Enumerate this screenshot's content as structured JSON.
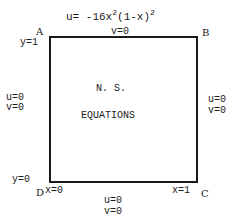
{
  "diagram": {
    "top_condition": {
      "u_prefix": "u=  -16x",
      "exp1": "2",
      "mid": "(1-x)",
      "exp2": "2",
      "v": "v=0"
    },
    "corners": {
      "A": "A",
      "B": "B",
      "C": "C",
      "D": "D"
    },
    "axis_labels": {
      "y_top": "y=1",
      "y_bottom": "y=0",
      "x_left": "x=0",
      "x_right": "x=1"
    },
    "left_condition": {
      "u": "u=0",
      "v": "v=0"
    },
    "right_condition": {
      "u": "u=0",
      "v": "v=0"
    },
    "bottom_condition": {
      "u": "u=0",
      "v": "v=0"
    },
    "center_text": {
      "line1": "N. S.",
      "line2": "EQUATIONS"
    }
  }
}
